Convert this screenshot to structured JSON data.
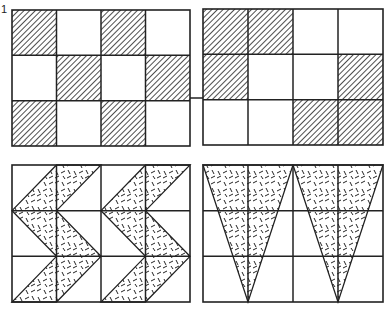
{
  "figure": {
    "label": "1",
    "stroke_color": "#222222",
    "background": "#ffffff",
    "panels": [
      {
        "id": "top-left",
        "type": "checker-hatch",
        "x": 12,
        "y": 10,
        "w": 178,
        "h": 136,
        "cols": 4,
        "rows": 3,
        "fill": "diagonal-hatch",
        "shaded_cells": [
          [
            0,
            0
          ],
          [
            0,
            2
          ],
          [
            1,
            1
          ],
          [
            1,
            3
          ],
          [
            2,
            0
          ],
          [
            2,
            2
          ]
        ]
      },
      {
        "id": "top-right",
        "type": "checker-hatch",
        "x": 203,
        "y": 9,
        "w": 180,
        "h": 136,
        "cols": 4,
        "rows": 3,
        "fill": "diagonal-hatch",
        "shaded_cells": [
          [
            0,
            0
          ],
          [
            0,
            1
          ],
          [
            1,
            0
          ],
          [
            1,
            3
          ],
          [
            2,
            2
          ],
          [
            2,
            3
          ]
        ]
      },
      {
        "id": "bottom-left",
        "type": "chevron",
        "x": 12,
        "y": 165,
        "w": 178,
        "h": 137,
        "cols": 4,
        "rows": 3,
        "fill": "dash-texture",
        "bands": 2
      },
      {
        "id": "bottom-right",
        "type": "triangles",
        "x": 203,
        "y": 165,
        "w": 180,
        "h": 137,
        "cols": 4,
        "rows": 3,
        "fill": "dash-texture",
        "triangles": 2
      }
    ],
    "connector_line": {
      "x1": 190,
      "x2": 203,
      "y": 98
    }
  }
}
